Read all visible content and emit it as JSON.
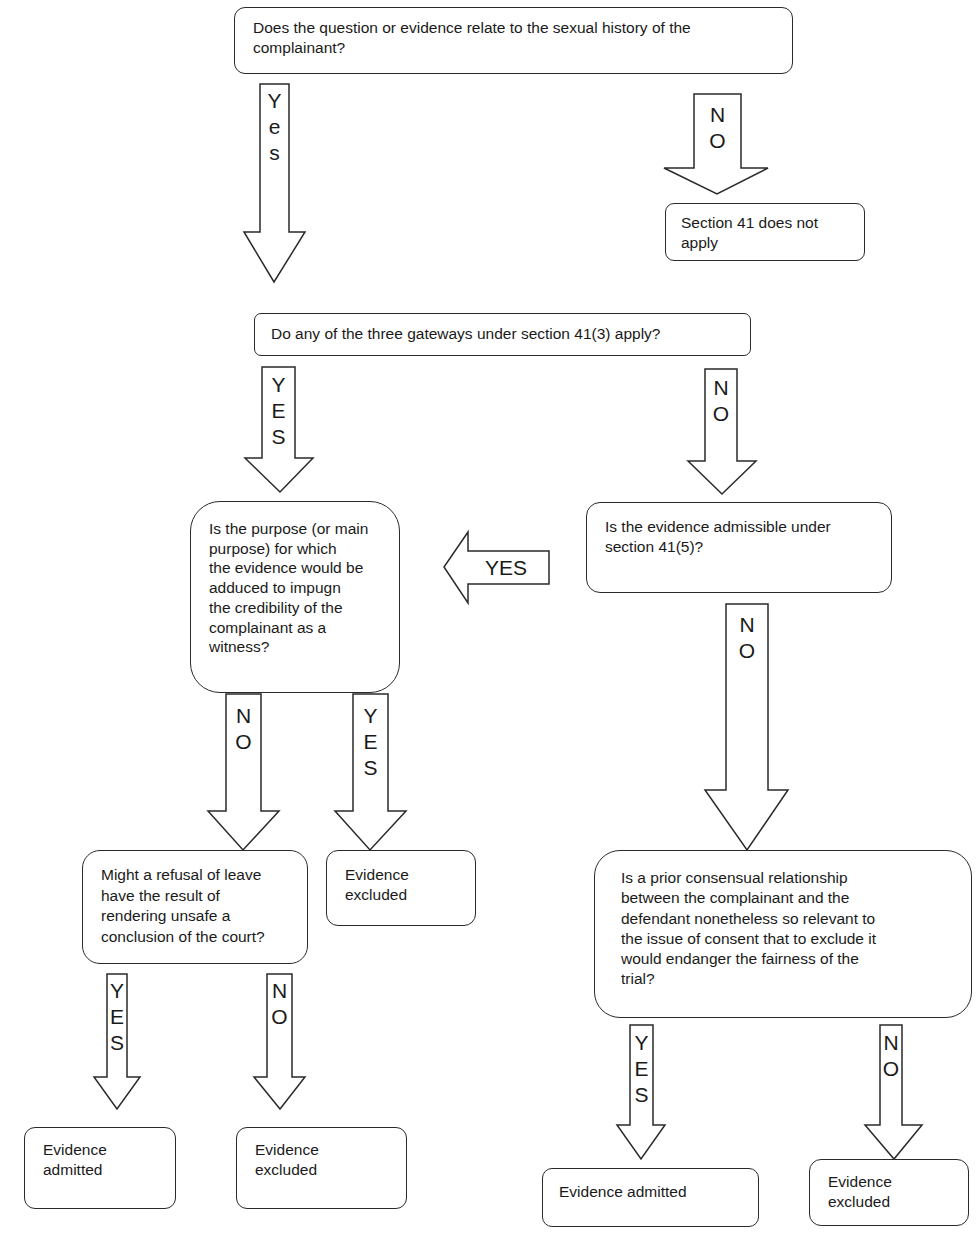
{
  "flowchart": {
    "nodes": {
      "q1": "Does the question or evidence relate to the sexual history of the complainant?",
      "not_apply": "Section 41 does not\napply",
      "q2": "Do any of the three gateways under section 41(3) apply?",
      "q3": "Is the purpose (or main\npurpose) for which\nthe evidence would be\nadduced to impugn\nthe credibility of the\ncomplainant as a\nwitness?",
      "q4": "Is the evidence admissible under\nsection 41(5)?",
      "q5": "Might a refusal of leave\nhave the result of\nrendering unsafe a\nconclusion of the court?",
      "excluded_a": "Evidence\nexcluded",
      "q6": "Is a prior consensual relationship\nbetween the complainant and the\ndefendant nonetheless so relevant to\nthe issue of consent that  to exclude it\nwould endanger the fairness of the\ntrial?",
      "admitted_b": "Evidence\nadmitted",
      "excluded_b": "Evidence\nexcluded",
      "admitted_c": "Evidence admitted",
      "excluded_c": "Evidence\nexcluded"
    },
    "arrows": {
      "q1_yes": "Y\ne\ns",
      "q1_no": "N\nO",
      "q2_yes": "Y\nE\nS",
      "q2_no": "N\nO",
      "q4_yes": "YES",
      "q4_no": "N\nO",
      "q3_no": "N\nO",
      "q3_yes": "Y\nE\nS",
      "q5_yes": "Y\nE\nS",
      "q5_no": "N\nO",
      "q6_yes": "Y\nE\nS",
      "q6_no": "N\nO"
    }
  }
}
